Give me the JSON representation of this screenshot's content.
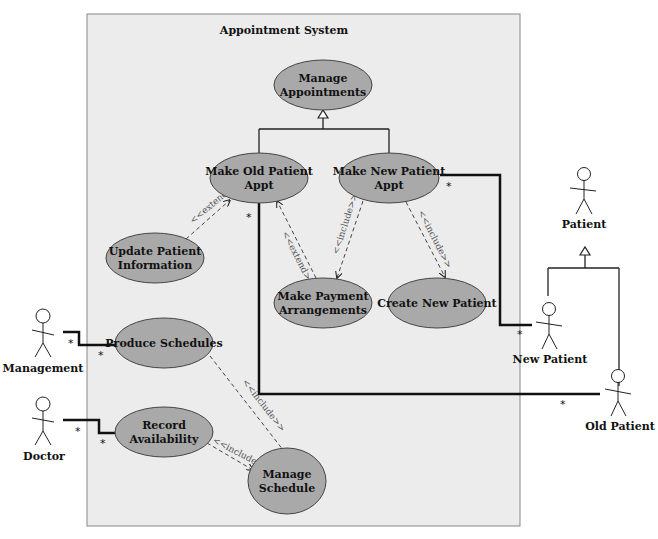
{
  "system": {
    "title": "Appointment System",
    "background": "#ececec",
    "use_case_fill": "#a9a9a9"
  },
  "use_cases": [
    {
      "id": "manage-appointments",
      "lines": [
        "Manage",
        "Appointments"
      ]
    },
    {
      "id": "make-old-patient-appt",
      "lines": [
        "Make Old Patient",
        "Appt"
      ]
    },
    {
      "id": "make-new-patient-appt",
      "lines": [
        "Make New Patient",
        "Appt"
      ]
    },
    {
      "id": "update-patient-information",
      "lines": [
        "Update Patient",
        "Information"
      ]
    },
    {
      "id": "make-payment-arrangements",
      "lines": [
        "Make Payment",
        "Arrangements"
      ]
    },
    {
      "id": "create-new-patient",
      "lines": [
        "Create New Patient"
      ]
    },
    {
      "id": "produce-schedules",
      "lines": [
        "Produce Schedules"
      ]
    },
    {
      "id": "record-availability",
      "lines": [
        "Record",
        "Availability"
      ]
    },
    {
      "id": "manage-schedule",
      "lines": [
        "Manage",
        "Schedule"
      ]
    }
  ],
  "actors": [
    {
      "id": "management",
      "label": "Management"
    },
    {
      "id": "doctor",
      "label": "Doctor"
    },
    {
      "id": "patient",
      "label": "Patient"
    },
    {
      "id": "new-patient",
      "label": "New Patient"
    },
    {
      "id": "old-patient",
      "label": "Old Patient"
    }
  ],
  "relationships": {
    "extend_label": "<<extend>>",
    "include_label": "<<include>>",
    "multiplicity": "*"
  }
}
